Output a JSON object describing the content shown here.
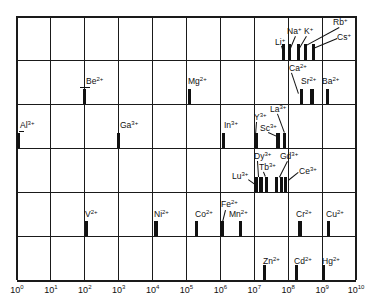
{
  "chart_data": {
    "type": "bar",
    "title": "",
    "xlabel": "",
    "ylabel": "",
    "x_scale": "log10",
    "xlim": [
      0,
      10
    ],
    "x_ticks": [
      "10^0",
      "10^1",
      "10^2",
      "10^3",
      "10^4",
      "10^5",
      "10^6",
      "10^7",
      "10^8",
      "10^9",
      "10^10"
    ],
    "grid": true,
    "rows": [
      {
        "group": "M+",
        "ions": [
          {
            "ion": "Li",
            "charge": "+",
            "log_x": 7.85
          },
          {
            "ion": "Na",
            "charge": "+",
            "log_x": 8.05
          },
          {
            "ion": "K",
            "charge": "+",
            "log_x": 8.3
          },
          {
            "ion": "Rb",
            "charge": "+",
            "log_x": 8.5
          },
          {
            "ion": "Cs",
            "charge": "+",
            "log_x": 8.75
          }
        ]
      },
      {
        "group": "M2+ (alkaline earth)",
        "ions": [
          {
            "ion": "Be",
            "charge": "2+",
            "log_x": 2.0
          },
          {
            "ion": "Mg",
            "charge": "2+",
            "log_x": 5.1
          },
          {
            "ion": "Ca",
            "charge": "2+",
            "log_x": 8.4
          },
          {
            "ion": "Sr",
            "charge": "2+",
            "log_x": 8.7
          },
          {
            "ion": "Ba",
            "charge": "2+",
            "log_x": 9.15
          }
        ]
      },
      {
        "group": "M3+",
        "ions": [
          {
            "ion": "Al",
            "charge": "3+",
            "log_x": 0.05
          },
          {
            "ion": "Ga",
            "charge": "3+",
            "log_x": 3.0
          },
          {
            "ion": "In",
            "charge": "3+",
            "log_x": 6.1
          },
          {
            "ion": "Y",
            "charge": "3+",
            "log_x": 7.05
          },
          {
            "ion": "Sc",
            "charge": "3+",
            "log_x": 7.7
          },
          {
            "ion": "La",
            "charge": "3+",
            "log_x": 7.9
          }
        ]
      },
      {
        "group": "Lanthanides 3+",
        "ions": [
          {
            "ion": "Lu",
            "charge": "3+",
            "log_x": 7.05
          },
          {
            "ion": "Dy",
            "charge": "3+",
            "log_x": 7.2
          },
          {
            "ion": "Tb",
            "charge": "3+",
            "log_x": 7.35
          },
          {
            "ion": "Gd",
            "charge": "3+",
            "log_x": 7.65
          },
          {
            "ion": "Gd2",
            "charge": "3+",
            "log_x": 7.8
          },
          {
            "ion": "Ce",
            "charge": "3+",
            "log_x": 7.92
          }
        ]
      },
      {
        "group": "Transition M2+",
        "ions": [
          {
            "ion": "V",
            "charge": "2+",
            "log_x": 2.05
          },
          {
            "ion": "Ni",
            "charge": "2+",
            "log_x": 4.1
          },
          {
            "ion": "Co",
            "charge": "2+",
            "log_x": 5.3
          },
          {
            "ion": "Fe",
            "charge": "2+",
            "log_x": 6.05
          },
          {
            "ion": "Mn",
            "charge": "2+",
            "log_x": 6.6
          },
          {
            "ion": "Cr",
            "charge": "2+",
            "log_x": 8.35
          },
          {
            "ion": "Cu",
            "charge": "2+",
            "log_x": 9.2
          }
        ]
      },
      {
        "group": "Group 12 M2+",
        "ions": [
          {
            "ion": "Zn",
            "charge": "2+",
            "log_x": 7.3
          },
          {
            "ion": "Cd",
            "charge": "2+",
            "log_x": 8.25
          },
          {
            "ion": "Hg",
            "charge": "2+",
            "log_x": 9.05
          }
        ]
      }
    ]
  },
  "labels": {
    "row0": [
      {
        "sym": "Li",
        "chg": "+",
        "x": 275,
        "y": 38
      },
      {
        "sym": "Na",
        "chg": "+",
        "x": 287,
        "y": 27
      },
      {
        "sym": "K",
        "chg": "+",
        "x": 304,
        "y": 27
      },
      {
        "sym": "Rb",
        "chg": "+",
        "x": 333,
        "y": 18
      },
      {
        "sym": "Cs",
        "chg": "+",
        "x": 337,
        "y": 33
      }
    ],
    "row1": [
      {
        "sym": "Be",
        "chg": "2+",
        "x": 86,
        "y": 77
      },
      {
        "sym": "Mg",
        "chg": "2+",
        "x": 188,
        "y": 77
      },
      {
        "sym": "Ca",
        "chg": "2+",
        "x": 289,
        "y": 64
      },
      {
        "sym": "Sr",
        "chg": "2+",
        "x": 301,
        "y": 77
      },
      {
        "sym": "Ba",
        "chg": "2+",
        "x": 322,
        "y": 77
      }
    ],
    "row2": [
      {
        "sym": "Al",
        "chg": "3+",
        "x": 20,
        "y": 121
      },
      {
        "sym": "Ga",
        "chg": "3+",
        "x": 120,
        "y": 121
      },
      {
        "sym": "In",
        "chg": "3+",
        "x": 224,
        "y": 121
      },
      {
        "sym": "Y",
        "chg": "3+",
        "x": 254,
        "y": 113
      },
      {
        "sym": "Sc",
        "chg": "3+",
        "x": 260,
        "y": 124
      },
      {
        "sym": "La",
        "chg": "3+",
        "x": 270,
        "y": 105
      }
    ],
    "row3": [
      {
        "sym": "Lu",
        "chg": "3+",
        "x": 232,
        "y": 172
      },
      {
        "sym": "Dy",
        "chg": "3+",
        "x": 254,
        "y": 152
      },
      {
        "sym": "Tb",
        "chg": "3+",
        "x": 259,
        "y": 163
      },
      {
        "sym": "Gd",
        "chg": "3+",
        "x": 280,
        "y": 152
      },
      {
        "sym": "Ce",
        "chg": "3+",
        "x": 299,
        "y": 167
      }
    ],
    "row4": [
      {
        "sym": "V",
        "chg": "2+",
        "x": 85,
        "y": 210
      },
      {
        "sym": "Ni",
        "chg": "2+",
        "x": 154,
        "y": 210
      },
      {
        "sym": "Co",
        "chg": "2+",
        "x": 195,
        "y": 210
      },
      {
        "sym": "Fe",
        "chg": "2+",
        "x": 221,
        "y": 200
      },
      {
        "sym": "Mn",
        "chg": "2+",
        "x": 229,
        "y": 210
      },
      {
        "sym": "Cr",
        "chg": "2+",
        "x": 296,
        "y": 210
      },
      {
        "sym": "Cu",
        "chg": "2+",
        "x": 326,
        "y": 210
      }
    ],
    "row5": [
      {
        "sym": "Zn",
        "chg": "2+",
        "x": 263,
        "y": 257
      },
      {
        "sym": "Cd",
        "chg": "2+",
        "x": 294,
        "y": 257
      },
      {
        "sym": "Hg",
        "chg": "2+",
        "x": 322,
        "y": 257
      }
    ]
  },
  "ticks": [
    {
      "base": "10",
      "exp": "0"
    },
    {
      "base": "10",
      "exp": "1"
    },
    {
      "base": "10",
      "exp": "2"
    },
    {
      "base": "10",
      "exp": "3"
    },
    {
      "base": "10",
      "exp": "4"
    },
    {
      "base": "10",
      "exp": "5"
    },
    {
      "base": "10",
      "exp": "6"
    },
    {
      "base": "10",
      "exp": "7"
    },
    {
      "base": "10",
      "exp": "8"
    },
    {
      "base": "10",
      "exp": "9"
    },
    {
      "base": "10",
      "exp": "10"
    }
  ]
}
